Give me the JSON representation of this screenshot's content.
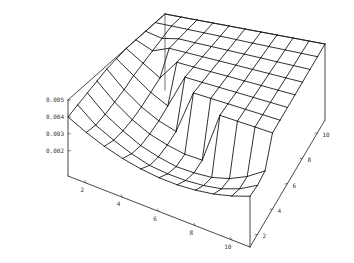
{
  "chart_data": {
    "type": "surface3d",
    "title": "",
    "xlabel": "",
    "ylabel": "",
    "zlabel": "",
    "x": [
      1,
      2,
      3,
      4,
      5,
      6,
      7,
      8,
      9,
      10,
      11
    ],
    "y": [
      1,
      2,
      3,
      4,
      5,
      6,
      7,
      8,
      9,
      10,
      11
    ],
    "xlim": [
      1,
      11
    ],
    "ylim": [
      1,
      11
    ],
    "zlim": [
      0.0015,
      0.005
    ],
    "x_ticks": [
      "2",
      "4",
      "6",
      "8",
      "10"
    ],
    "y_ticks": [
      "2",
      "4",
      "6",
      "8",
      "10"
    ],
    "z_ticks": [
      "0.002",
      "0.003",
      "0.004",
      "0.005"
    ],
    "boxed": true,
    "grid": false,
    "mesh": "wireframe",
    "z_samples": [
      [
        0.004,
        0.0035,
        0.0031,
        0.0028,
        0.0026,
        0.0025,
        0.0025,
        0.0026,
        0.0028,
        0.0031,
        0.0035
      ],
      [
        0.0042,
        0.0034,
        0.0029,
        0.0025,
        0.0022,
        0.0021,
        0.0021,
        0.0022,
        0.0024,
        0.0028,
        0.0034
      ],
      [
        0.0044,
        0.0035,
        0.0029,
        0.0024,
        0.0021,
        0.0019,
        0.0019,
        0.002,
        0.0023,
        0.0028,
        0.0035
      ],
      [
        0.0046,
        0.0037,
        0.003,
        0.0025,
        0.0022,
        0.002,
        0.002,
        0.005,
        0.005,
        0.005,
        0.005
      ],
      [
        0.0048,
        0.0039,
        0.0032,
        0.0027,
        0.0024,
        0.005,
        0.005,
        0.005,
        0.005,
        0.005,
        0.005
      ],
      [
        0.0049,
        0.0042,
        0.0035,
        0.003,
        0.005,
        0.005,
        0.005,
        0.005,
        0.005,
        0.005,
        0.005
      ],
      [
        0.005,
        0.0044,
        0.0038,
        0.005,
        0.005,
        0.005,
        0.005,
        0.005,
        0.005,
        0.005,
        0.005
      ],
      [
        0.005,
        0.0046,
        0.005,
        0.005,
        0.005,
        0.005,
        0.005,
        0.005,
        0.005,
        0.005,
        0.005
      ],
      [
        0.005,
        0.0048,
        0.005,
        0.005,
        0.005,
        0.005,
        0.005,
        0.005,
        0.005,
        0.005,
        0.005
      ],
      [
        0.005,
        0.005,
        0.005,
        0.005,
        0.005,
        0.005,
        0.005,
        0.005,
        0.005,
        0.005,
        0.005
      ],
      [
        0.005,
        0.005,
        0.005,
        0.005,
        0.005,
        0.005,
        0.005,
        0.005,
        0.005,
        0.005,
        0.005
      ]
    ]
  },
  "projection": {
    "base_front_left": [
      68,
      176
    ],
    "base_front_right": [
      250,
      247
    ],
    "base_back_right": [
      325,
      120
    ],
    "base_back_left": [
      165,
      90
    ],
    "z_scale_px": 76,
    "z_min": 0.0005
  },
  "style": {
    "line_color": "#1a1a1a",
    "box_color": "#333333",
    "background": "#ffffff"
  }
}
